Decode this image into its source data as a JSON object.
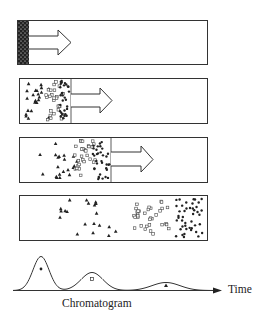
{
  "diagram": {
    "columns": [
      {
        "step": 1,
        "description": "Sample mixture loaded at column inlet",
        "band_end_x": 29,
        "arrow": true
      },
      {
        "step": 2,
        "description": "Components begin to separate",
        "band_end_x": 71,
        "arrow": true
      },
      {
        "step": 3,
        "description": "Further separation as band migrates",
        "band_end_x": 111,
        "arrow": true
      },
      {
        "step": 4,
        "description": "Components fully resolved into three zones",
        "arrow": false
      }
    ],
    "components": [
      {
        "symbol": "filled-circle",
        "name": "fastest component"
      },
      {
        "symbol": "open-square",
        "name": "intermediate component"
      },
      {
        "symbol": "filled-triangle",
        "name": "slowest component"
      }
    ],
    "chromatogram": {
      "label": "Chromatogram",
      "axis_label": "Time",
      "peaks": [
        {
          "symbol": "filled-circle",
          "center_x": 41,
          "relative_height": 1.0
        },
        {
          "symbol": "open-square",
          "center_x": 92,
          "relative_height": 0.53
        },
        {
          "symbol": "filled-triangle",
          "center_x": 166,
          "relative_height": 0.24
        }
      ]
    },
    "colors": {
      "ink": "#222222",
      "background": "#ffffff"
    }
  }
}
